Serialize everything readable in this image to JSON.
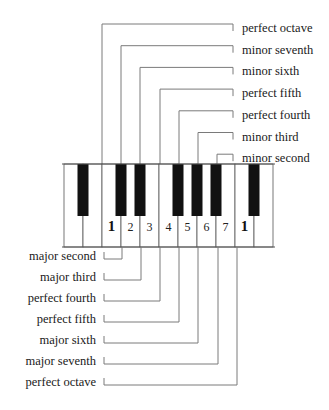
{
  "keyboard": {
    "white_keys": 11,
    "black_key_after_white": [
      0,
      2,
      3,
      5,
      6,
      7,
      9
    ],
    "scale_degree_labels": [
      {
        "key": 2,
        "text": "1",
        "bold": true
      },
      {
        "key": 3,
        "text": "2",
        "bold": false
      },
      {
        "key": 4,
        "text": "3",
        "bold": false
      },
      {
        "key": 5,
        "text": "4",
        "bold": false
      },
      {
        "key": 6,
        "text": "5",
        "bold": false
      },
      {
        "key": 7,
        "text": "6",
        "bold": false
      },
      {
        "key": 8,
        "text": "7",
        "bold": false
      },
      {
        "key": 9,
        "text": "1",
        "bold": true
      }
    ]
  },
  "upper_intervals": [
    {
      "label": "perfect octave",
      "semitones": 12
    },
    {
      "label": "minor seventh",
      "semitones": 10
    },
    {
      "label": "minor sixth",
      "semitones": 8
    },
    {
      "label": "perfect fifth",
      "semitones": 7
    },
    {
      "label": "perfect fourth",
      "semitones": 5
    },
    {
      "label": "minor third",
      "semitones": 3
    },
    {
      "label": "minor second",
      "semitones": 1
    }
  ],
  "lower_intervals": [
    {
      "label": "major second",
      "semitones": 2
    },
    {
      "label": "major third",
      "semitones": 4
    },
    {
      "label": "perfect fourth",
      "semitones": 5
    },
    {
      "label": "perfect fifth",
      "semitones": 7
    },
    {
      "label": "major sixth",
      "semitones": 9
    },
    {
      "label": "major seventh",
      "semitones": 11
    },
    {
      "label": "perfect octave",
      "semitones": 12
    }
  ],
  "colors": {
    "black_key": "#111111",
    "white_key": "#ffffff",
    "key_outline": "#555555",
    "bracket": "#7a7a7a",
    "text": "#1a1a1a"
  }
}
